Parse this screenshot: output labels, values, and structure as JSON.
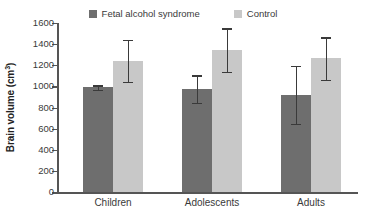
{
  "chart_data": {
    "type": "bar",
    "title": "",
    "xlabel": "",
    "ylabel": "Brain volume (cm3)",
    "ylabel_base": "Brain volume (cm",
    "ylabel_sup": "3",
    "ylabel_tail": ")",
    "categories": [
      "Children",
      "Adolescents",
      "Adults"
    ],
    "ylim": [
      0,
      1600
    ],
    "yticks": [
      0,
      200,
      400,
      600,
      800,
      1000,
      1200,
      1400,
      1600
    ],
    "grid": false,
    "legend_position": "top-center",
    "series": [
      {
        "name": "Fetal alcohol syndrome",
        "color": "#6e6e6e",
        "values": [
          990,
          975,
          920
        ],
        "errors": [
          20,
          130,
          275
        ],
        "error_low": [
          970,
          845,
          645
        ],
        "error_high": [
          1010,
          1105,
          1195
        ]
      },
      {
        "name": "Control",
        "color": "#c8c8c8",
        "values": [
          1240,
          1345,
          1265
        ],
        "errors": [
          200,
          205,
          200
        ],
        "error_low": [
          1040,
          1140,
          1065
        ],
        "error_high": [
          1440,
          1550,
          1465
        ]
      }
    ]
  },
  "legend": {
    "items": [
      {
        "label": "Fetal alcohol syndrome",
        "color": "#6e6e6e",
        "swatch_name": "legend-swatch-fas"
      },
      {
        "label": "Control",
        "color": "#c8c8c8",
        "swatch_name": "legend-swatch-control"
      }
    ]
  },
  "axis": {
    "tick_labels": [
      "1600",
      "1400",
      "1200",
      "1000",
      "800",
      "600",
      "400",
      "200",
      "0"
    ]
  }
}
